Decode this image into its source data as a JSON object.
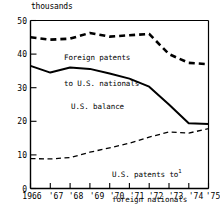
{
  "chart_data": {
    "type": "line",
    "title": "",
    "subtitle": "",
    "xlabel": "",
    "ylabel": "thousands",
    "unit_note": "thousands",
    "xlim": [
      1966,
      1975
    ],
    "ylim": [
      0,
      50
    ],
    "ytick_values": [
      0,
      10,
      20,
      30,
      40,
      50
    ],
    "ytick_labels": [
      "0",
      "10",
      "20",
      "30",
      "40",
      "50"
    ],
    "x": [
      1966,
      1967,
      1968,
      1969,
      1970,
      1971,
      1972,
      1973,
      1974,
      1975
    ],
    "xtick_labels": [
      "1966",
      "'67",
      "'68",
      "'69",
      "'70",
      "'71",
      "'72",
      "'73",
      "'74",
      "'75"
    ],
    "grid": false,
    "legend": "inline-annotations",
    "series": [
      {
        "name": "Foreign patents to U.S. nationals",
        "style": "heavy-dashed",
        "color": "#000000",
        "values": [
          45.0,
          44.3,
          44.6,
          46.3,
          45.2,
          45.6,
          46.0,
          40.0,
          37.4,
          37.0
        ]
      },
      {
        "name": "U.S. balance",
        "style": "solid",
        "color": "#000000",
        "values": [
          36.5,
          34.5,
          36.0,
          35.6,
          34.2,
          32.7,
          30.3,
          25.0,
          19.4,
          19.2
        ]
      },
      {
        "name": "U.S. patents to foreign nationals",
        "style": "light-dashed",
        "color": "#000000",
        "values": [
          8.9,
          8.8,
          9.2,
          10.8,
          12.1,
          13.5,
          15.3,
          16.8,
          16.5,
          17.8
        ]
      }
    ],
    "annotations": [
      {
        "id": "foreign-patents-label",
        "line1": "Foreign patents",
        "line2": "to U.S. nationals",
        "footnote": ""
      },
      {
        "id": "us-balance-label",
        "line1": "U.S. balance",
        "line2": "",
        "footnote": ""
      },
      {
        "id": "us-patents-foreign-label",
        "line1": "U.S. patents to",
        "line2": "foreign nationals",
        "footnote": "1"
      }
    ]
  }
}
